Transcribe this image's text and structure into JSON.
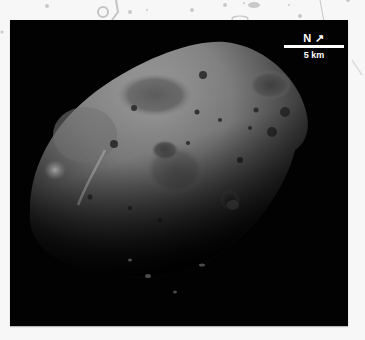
{
  "figure": {
    "panel_background": "#020202",
    "page_background": "#f7f7f7"
  },
  "scale_bar": {
    "north_label": "N",
    "north_arrow": "↗",
    "distance_label": "5 km",
    "color": "#ffffff"
  }
}
